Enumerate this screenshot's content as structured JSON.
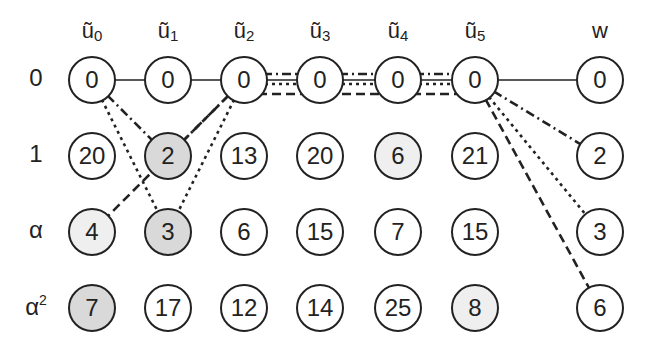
{
  "columns": [
    {
      "id": "u0",
      "base": "ũ",
      "sub": "0",
      "x": 92
    },
    {
      "id": "u1",
      "base": "ũ",
      "sub": "1",
      "x": 168
    },
    {
      "id": "u2",
      "base": "ũ",
      "sub": "2",
      "x": 244
    },
    {
      "id": "u3",
      "base": "ũ",
      "sub": "3",
      "x": 320
    },
    {
      "id": "u4",
      "base": "ũ",
      "sub": "4",
      "x": 398
    },
    {
      "id": "u5",
      "base": "ũ",
      "sub": "5",
      "x": 475
    },
    {
      "id": "w",
      "base": "w",
      "sub": "",
      "x": 600
    }
  ],
  "rows": [
    {
      "id": "r0",
      "label": "0",
      "sup": "",
      "y": 80
    },
    {
      "id": "r1",
      "label": "1",
      "sup": "",
      "y": 156
    },
    {
      "id": "ra",
      "label": "α",
      "sup": "",
      "y": 232
    },
    {
      "id": "ra2",
      "label": "α",
      "sup": "2",
      "y": 308
    }
  ],
  "nodes": {
    "r0": [
      {
        "v": "0"
      },
      {
        "v": "0"
      },
      {
        "v": "0"
      },
      {
        "v": "0"
      },
      {
        "v": "0"
      },
      {
        "v": "0"
      },
      {
        "v": "0"
      }
    ],
    "r1": [
      {
        "v": "20"
      },
      {
        "v": "2",
        "shade": "dark"
      },
      {
        "v": "13"
      },
      {
        "v": "20"
      },
      {
        "v": "6",
        "shade": "light"
      },
      {
        "v": "21"
      },
      {
        "v": "2"
      }
    ],
    "ra": [
      {
        "v": "4",
        "shade": "light"
      },
      {
        "v": "3",
        "shade": "dark"
      },
      {
        "v": "6"
      },
      {
        "v": "15"
      },
      {
        "v": "7"
      },
      {
        "v": "15"
      },
      {
        "v": "3"
      }
    ],
    "ra2": [
      {
        "v": "7",
        "shade": "dark"
      },
      {
        "v": "17"
      },
      {
        "v": "12"
      },
      {
        "v": "14"
      },
      {
        "v": "25"
      },
      {
        "v": "8",
        "shade": "light"
      },
      {
        "v": "6"
      }
    ]
  },
  "edges": [
    {
      "from": [
        "u0",
        "r0"
      ],
      "to": [
        "w",
        "r0"
      ],
      "style": "solid"
    },
    {
      "from": [
        "u0",
        "r0"
      ],
      "to": [
        "u1",
        "r1"
      ],
      "style": "dashdot"
    },
    {
      "from": [
        "u0",
        "r0"
      ],
      "to": [
        "u1",
        "ra"
      ],
      "style": "dotted"
    },
    {
      "from": [
        "u2",
        "r0"
      ],
      "to": [
        "u1",
        "r1"
      ],
      "style": "dashdot"
    },
    {
      "from": [
        "u2",
        "r0"
      ],
      "to": [
        "u0",
        "ra"
      ],
      "style": "dashed"
    },
    {
      "from": [
        "u2",
        "r0"
      ],
      "to": [
        "u1",
        "ra"
      ],
      "style": "dotted"
    },
    {
      "from": [
        "u2",
        "r0"
      ],
      "to": [
        "u5",
        "r0"
      ],
      "style": "dashdot",
      "offset": -6
    },
    {
      "from": [
        "u2",
        "r0"
      ],
      "to": [
        "u5",
        "r0"
      ],
      "style": "dotted",
      "offset": 4
    },
    {
      "from": [
        "u2",
        "r0"
      ],
      "to": [
        "u5",
        "r0"
      ],
      "style": "dashed",
      "offset": 14
    },
    {
      "from": [
        "u5",
        "r0"
      ],
      "to": [
        "w",
        "r1"
      ],
      "style": "dashdot"
    },
    {
      "from": [
        "u5",
        "r0"
      ],
      "to": [
        "w",
        "ra"
      ],
      "style": "dotted"
    },
    {
      "from": [
        "u5",
        "r0"
      ],
      "to": [
        "w",
        "ra2"
      ],
      "style": "dashed"
    }
  ],
  "colors": {
    "stroke": "#222222",
    "shade_dark": "#d9d9d9",
    "shade_light": "#efefef",
    "background": "#ffffff"
  }
}
